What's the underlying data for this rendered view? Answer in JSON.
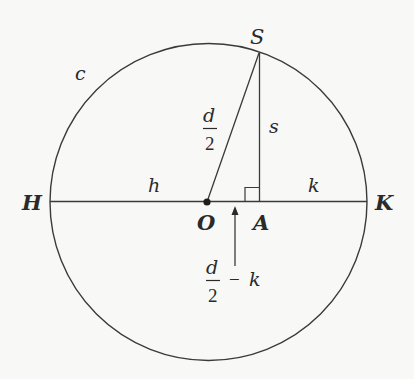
{
  "diagram": {
    "circle_label": "c",
    "points": {
      "S": "S",
      "H": "H",
      "K": "K",
      "O": "O",
      "A": "A"
    },
    "segment_labels": {
      "h": "h",
      "k": "k",
      "s": "s",
      "radius_numerator": "d",
      "radius_denominator": "2",
      "offset_numerator": "d",
      "offset_denominator": "2",
      "offset_minus": "−",
      "offset_k": "k"
    },
    "colors": {
      "stroke": "#3a3a3a",
      "background": "#f8f8f6"
    }
  }
}
